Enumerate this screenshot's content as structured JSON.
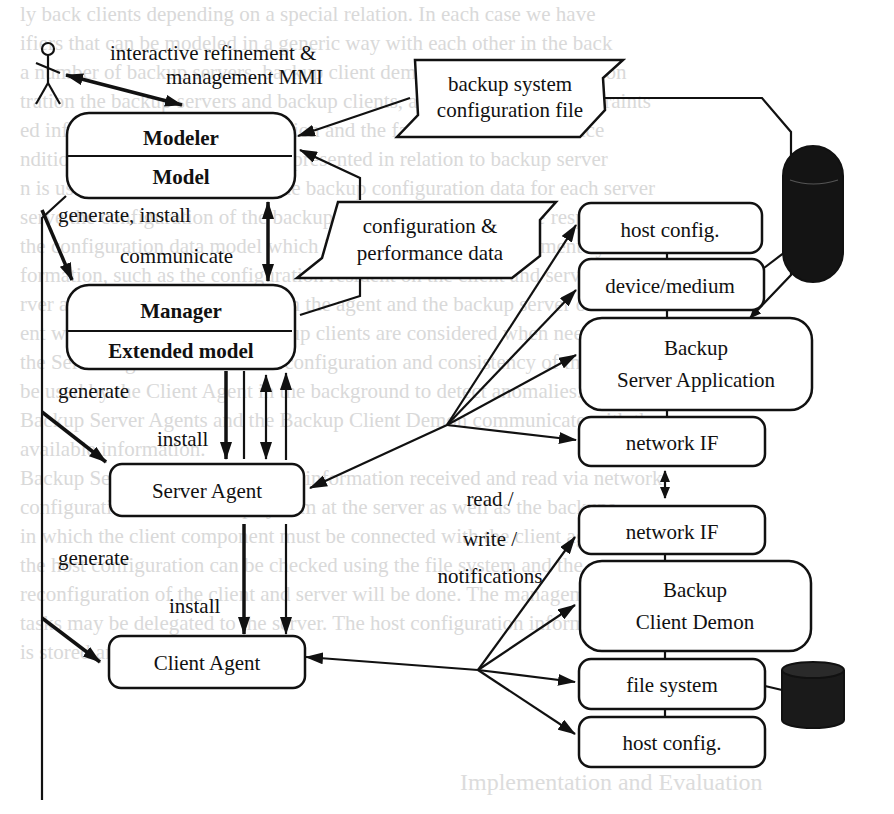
{
  "figure": {
    "actor": {
      "label": "user"
    },
    "mmi_label": {
      "line1": "interactive refinement &",
      "line2": "management MMI"
    },
    "modeler": {
      "title": "Modeler",
      "subtitle": "Model"
    },
    "manager": {
      "title": "Manager",
      "subtitle": "Extended model"
    },
    "server_agent": {
      "label": "Server Agent"
    },
    "client_agent": {
      "label": "Client Agent"
    },
    "config_file_tag": {
      "line1": "backup system",
      "line2": "configuration file"
    },
    "perf_data_tag": {
      "line1": "configuration &",
      "line2": "performance data"
    },
    "edge_labels": {
      "generate_install": "generate, install",
      "communicate": "communicate",
      "generate_server": "generate",
      "install_server": "install",
      "generate_client": "generate",
      "install_client": "install",
      "rwn_line1": "read /",
      "rwn_line2": "write /",
      "rwn_line3": "notifications"
    },
    "server_stack": {
      "host_config": "host config.",
      "device_medium": "device/medium",
      "app_line1": "Backup",
      "app_line2": "Server Application",
      "network_if": "network IF"
    },
    "client_stack": {
      "network_if": "network IF",
      "demon_line1": "Backup",
      "demon_line2": "Client Demon",
      "file_system": "file system",
      "host_config": "host config."
    },
    "storage": {
      "server_device": "tape/disk storage",
      "client_disk": "disk storage"
    }
  },
  "background": {
    "bleed_lines": [
      "ly back clients depending on a special relation. In each case we have",
      "ifiers that can be modeled in a generic way with each other in the back",
      "a number of backup servers, backup client demons, the configuration on",
      "tration the backup servers and backup clients, and client names, constraints",
      "ed inference upon the configuration and the failure data. Performance",
      "ndition of the configuration is represented in relation to backup server",
      "n is used for the evaluation of the backup configuration data for each server",
      "serve the configuration of the backup management. Agents are responsible",
      "the configuration data model which is the basis of the management system",
      "formation, such as the configuration resident on the client and server side",
      "rver and the relationship between the agent and the backup server of the",
      "ent with the set of possible backup clients are considered when needed",
      "the Server Agent as well as the configuration and consistency of the data",
      "be used by the Client Agent in the background to detect anomalies.",
      "Backup Server Agents and the Backup Client Demon communicate with the",
      "available information.",
      "Backup Server Agent collects the information received and read via network",
      "configuration of the backup system at the server as well as the backups",
      "in which the client component must be connected with the client agent",
      "the host configuration can be checked using the file system and the",
      "reconfiguration of the client and server will be done. The management",
      "tasks may be delegated to the server. The host configuration information",
      "is stored and available."
    ],
    "section_heading": "Implementation and Evaluation"
  }
}
